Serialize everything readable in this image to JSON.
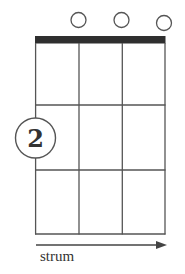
{
  "chord_diagram": {
    "instrument_strings": 4,
    "frets_shown": 3,
    "colors": {
      "nut": "#2f2f2f",
      "lines": "#555555",
      "text": "#333333",
      "background": "#ffffff"
    },
    "open_strings": [
      2,
      3,
      4
    ],
    "fingerings": [
      {
        "string": 1,
        "fret": 2,
        "finger": "2"
      }
    ],
    "strum_label": "strum",
    "strum_direction": "right"
  }
}
